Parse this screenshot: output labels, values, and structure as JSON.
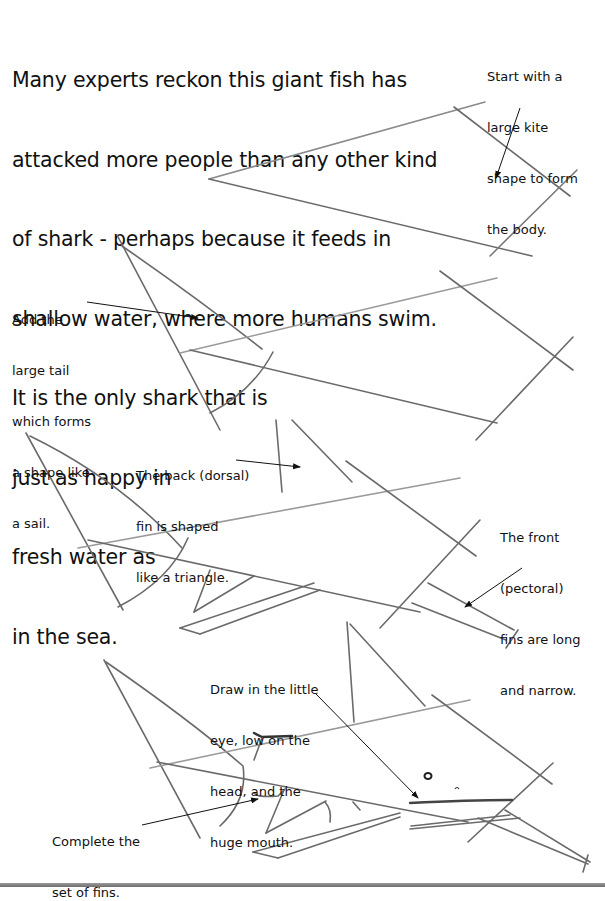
{
  "intro": {
    "lines": [
      "Many experts reckon this giant fish has",
      "attacked more people than any other kind",
      "of shark - perhaps because it feeds in",
      "shallow water, where more humans swim.",
      "It is the only shark that is",
      "just as happy in",
      "fresh water as",
      "in the sea."
    ]
  },
  "steps": [
    {
      "id": "step-1",
      "lines": [
        "Start with a",
        "large kite",
        "shape to form",
        "the body."
      ]
    },
    {
      "id": "step-2",
      "lines": [
        "Add the",
        "large tail",
        "which forms",
        "a shape like",
        "a sail."
      ]
    },
    {
      "id": "step-3",
      "lines": [
        "The back (dorsal)",
        "fin is shaped",
        "like a triangle."
      ]
    },
    {
      "id": "step-4",
      "lines": [
        "The front",
        "(pectoral)",
        "fins are long",
        "and narrow."
      ]
    },
    {
      "id": "step-5",
      "lines": [
        "Draw in the little",
        "eye, low on the",
        "head, and the",
        "huge mouth."
      ]
    },
    {
      "id": "step-6",
      "lines": [
        "Complete the",
        "set of fins."
      ]
    }
  ],
  "colors": {
    "pencil": "#6a6a6a",
    "pencil_light": "#9a9a9a",
    "ink": "#111111"
  }
}
